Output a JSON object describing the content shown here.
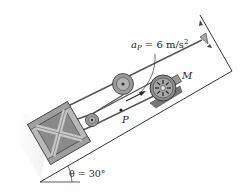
{
  "diagram": {
    "acceleration_label": {
      "symbol": "a",
      "subscript": "P",
      "value_text": " = 6 m/s",
      "exponent": "2"
    },
    "point_label": "P",
    "motor_label": "M",
    "angle_label": "θ = 30°",
    "incline_angle_deg": 30,
    "acceleration_value": 6,
    "acceleration_unit": "m/s²",
    "colors": {
      "incline_fill": "#ffffff",
      "outline": "#333333",
      "crate_fill": "#b8b8b8",
      "crate_dark": "#7a7a7a",
      "pulley_fill": "#9a9a9a",
      "motor_fill": "#8c8c8c",
      "anchor_fill": "#a8a8a8",
      "shadow": "#e6e6e6"
    }
  }
}
